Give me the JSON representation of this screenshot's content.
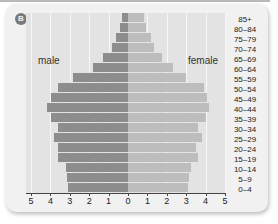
{
  "badge": "B",
  "labels": {
    "male": "male",
    "female": "female"
  },
  "colors": {
    "male": "#8d8d8d",
    "female": "#bdbdbd",
    "plot_bg": "#e3e3e3",
    "card_bg": "#f1f1f1"
  },
  "chart_data": {
    "type": "bar",
    "subtype": "population-pyramid",
    "title": "",
    "xlabel": "",
    "ylabel": "",
    "categories": [
      "85+",
      "80-84",
      "75-79",
      "70-74",
      "65-69",
      "60-64",
      "55-59",
      "50-54",
      "45-49",
      "40-44",
      "35-39",
      "30-34",
      "25-29",
      "20-24",
      "15-19",
      "10-14",
      "5-9",
      "0-4"
    ],
    "series": [
      {
        "name": "male",
        "side": "left",
        "values": [
          0.3,
          0.4,
          0.6,
          0.85,
          1.3,
          1.8,
          2.85,
          3.6,
          3.95,
          4.2,
          3.95,
          3.6,
          3.8,
          3.6,
          3.6,
          3.2,
          3.15,
          3.1
        ]
      },
      {
        "name": "female",
        "side": "right",
        "values": [
          0.85,
          0.95,
          1.2,
          1.35,
          1.75,
          2.3,
          3.0,
          3.9,
          4.05,
          4.2,
          4.0,
          3.6,
          3.8,
          3.5,
          3.6,
          3.25,
          3.15,
          3.1
        ]
      }
    ],
    "x_ticks": [
      "5",
      "4",
      "3",
      "2",
      "1",
      "0",
      "1",
      "2",
      "3",
      "4",
      "5"
    ],
    "xlim": [
      -5,
      5
    ],
    "grid": true,
    "legend": "inline labels: 'male' upper-left, 'female' upper-right"
  }
}
